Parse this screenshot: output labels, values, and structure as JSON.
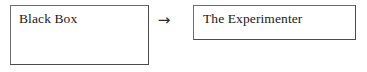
{
  "diagram": {
    "background_color": "#ffffff",
    "border_color": "#53555a",
    "text_color": "#1a1a1a",
    "nodes": [
      {
        "id": "black-box",
        "label": "Black Box",
        "shape": "rectangle",
        "text_align": "top-left"
      },
      {
        "id": "experimenter",
        "label": "The Experimenter",
        "shape": "rectangle",
        "text_align": "top-left"
      }
    ],
    "connectors": [
      {
        "id": "arrow-1",
        "glyph": "→",
        "icon_name": "right-arrow-icon",
        "from": "black-box",
        "to": "experimenter",
        "label": ""
      }
    ]
  }
}
